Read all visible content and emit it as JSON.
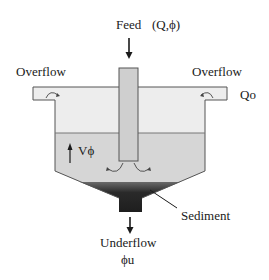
{
  "diagram": {
    "labels": {
      "feed": "Feed",
      "feed_params": "(Q,ϕ)",
      "overflow_left": "Overflow",
      "overflow_right": "Overflow",
      "overflow_flow": "Qo",
      "velocity": "Vϕ",
      "sediment": "Sediment",
      "underflow": "Underflow",
      "underflow_param": "ϕu"
    },
    "colors": {
      "clear_liquid": "#ededed",
      "suspension": "#d6d6d6",
      "sediment": "#2a2a2a",
      "pipe": "#cfcfcf",
      "outline": "#555555",
      "arrow": "#1a1a1a"
    },
    "nodes": [
      {
        "id": "feed_pipe",
        "label": "Feed (Q,ϕ)"
      },
      {
        "id": "overflow_left",
        "label": "Overflow"
      },
      {
        "id": "overflow_right",
        "label": "Overflow Qo"
      },
      {
        "id": "suspension_zone",
        "label": "Vϕ"
      },
      {
        "id": "sediment_zone",
        "label": "Sediment"
      },
      {
        "id": "underflow_outlet",
        "label": "Underflow ϕu"
      }
    ],
    "edges": [
      {
        "from": "feed",
        "to": "feed_pipe",
        "direction": "down"
      },
      {
        "from": "feed_pipe",
        "to": "suspension_zone",
        "direction": "outward"
      },
      {
        "from": "suspension_zone",
        "to": "overflow_left",
        "direction": "up"
      },
      {
        "from": "suspension_zone",
        "to": "overflow_right",
        "direction": "up"
      },
      {
        "from": "sediment_zone",
        "to": "underflow_outlet",
        "direction": "down"
      }
    ]
  }
}
